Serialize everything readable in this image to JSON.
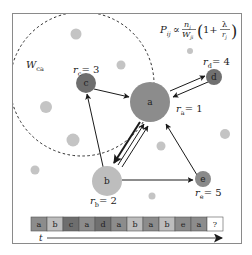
{
  "formula": {
    "lhs": "P",
    "lhs_sub": "ij",
    "prop": "∝",
    "num": "n",
    "num_sub": "j",
    "den": "W",
    "den_sub": "ji",
    "paren_open": "(",
    "one_plus": "1+",
    "lambda": "λ",
    "r": "r",
    "r_sub": "j",
    "paren_close": ")"
  },
  "window_label": {
    "main": "W",
    "sub": "ca"
  },
  "nodes": [
    {
      "id": "a",
      "label": "a",
      "rank_label": "r",
      "rank_sub": "a",
      "rank_value": "= 1",
      "color": "#8c8c8c"
    },
    {
      "id": "b",
      "label": "b",
      "rank_label": "r",
      "rank_sub": "b",
      "rank_value": "= 2",
      "color": "#bdbdbd"
    },
    {
      "id": "c",
      "label": "c",
      "rank_label": "r",
      "rank_sub": "c",
      "rank_value": "= 3",
      "color": "#6e6e6e"
    },
    {
      "id": "d",
      "label": "d",
      "rank_label": "r",
      "rank_sub": "d",
      "rank_value": "= 4",
      "color": "#707070"
    },
    {
      "id": "e",
      "label": "e",
      "rank_label": "r",
      "rank_sub": "e",
      "rank_value": "= 5",
      "color": "#8a8a8a"
    }
  ],
  "sequence": {
    "items": [
      "a",
      "b",
      "c",
      "a",
      "d",
      "a",
      "b",
      "a",
      "b",
      "e",
      "a",
      "?"
    ],
    "colors": [
      "#8c8c8c",
      "#bdbdbd",
      "#6e6e6e",
      "#8c8c8c",
      "#707070",
      "#8c8c8c",
      "#bdbdbd",
      "#8c8c8c",
      "#bdbdbd",
      "#8a8a8a",
      "#8c8c8c",
      "#ffffff"
    ]
  },
  "time_axis": {
    "label": "t"
  }
}
